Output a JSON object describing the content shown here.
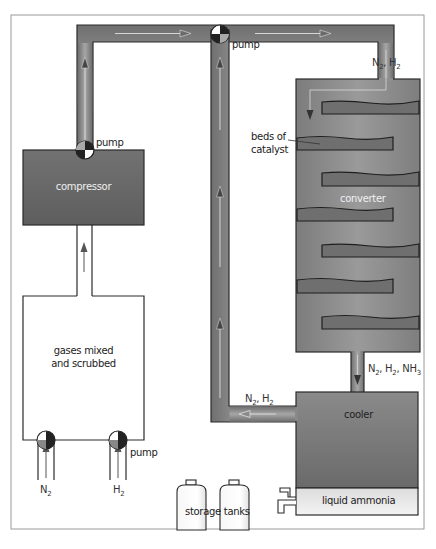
{
  "diagram": {
    "colors": {
      "pipe": "#8a8a8a",
      "pipe_edge": "#2a2a2a",
      "vessel_dark": "#6b6b6b",
      "converter": "#888888",
      "catalyst_bed": "#6e6e6e",
      "liquid": "#e8e8e8",
      "flow_arrow": "#d9d9d9",
      "frame": "#9a9a9a"
    },
    "components": {
      "compressor": {
        "label": "compressor"
      },
      "mixer": {
        "label_line1": "gases mixed",
        "label_line2": "and scrubbed"
      },
      "converter": {
        "label": "converter",
        "beds_label_line1": "beds of",
        "beds_label_line2": "catalyst",
        "bed_count": 7
      },
      "cooler": {
        "label": "cooler"
      },
      "liquid_ammonia": {
        "label": "liquid ammonia"
      },
      "storage_tanks": {
        "label": "storage tanks",
        "count": 2
      }
    },
    "pumps": [
      {
        "id": "pump-compressor",
        "label": "pump"
      },
      {
        "id": "pump-recycle",
        "label": "pump"
      },
      {
        "id": "pump-n2",
        "label": ""
      },
      {
        "id": "pump-h2",
        "label": "pump"
      }
    ],
    "flow_labels": {
      "to_converter": {
        "a": "N",
        "a_sub": "2",
        "sep": ", ",
        "b": "H",
        "b_sub": "2"
      },
      "to_cooler": {
        "a": "N",
        "a_sub": "2",
        "b": "H",
        "b_sub": "2",
        "c": "NH",
        "c_sub": "3"
      },
      "recycle": {
        "a": "N",
        "a_sub": "2",
        "b": "H",
        "b_sub": "2"
      },
      "input_n2": {
        "a": "N",
        "a_sub": "2"
      },
      "input_h2": {
        "a": "H",
        "a_sub": "2"
      }
    }
  }
}
